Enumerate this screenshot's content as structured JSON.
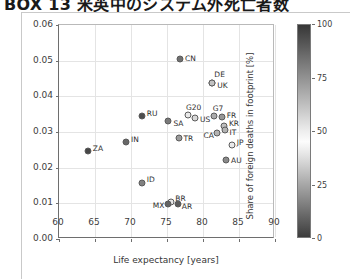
{
  "page_header": {
    "title": "BOX 13  米英中のシステム外死亡者数"
  },
  "chart_data": {
    "type": "scatter",
    "title": "",
    "xlabel": "Life expectancy [years]",
    "ylabel": "Lifetime-induced deaths [deaths/cap]",
    "xlim": [
      60,
      90
    ],
    "ylim": [
      0.0,
      0.06
    ],
    "xticks": [
      60,
      65,
      70,
      75,
      80,
      85,
      90
    ],
    "xticklabels": [
      "60",
      "65",
      "70",
      "75",
      "80",
      "85",
      "90"
    ],
    "yticks": [
      0.0,
      0.01,
      0.02,
      0.03,
      0.04,
      0.05,
      0.06
    ],
    "yticklabels": [
      "0.00",
      "0.01",
      "0.02",
      "0.03",
      "0.04",
      "0.05",
      "0.06"
    ],
    "grid": true,
    "legend": "none",
    "colorbar": {
      "label": "Share of foreign deaths in footprint [%]",
      "ticks": [
        0,
        25,
        50,
        75,
        100
      ],
      "ticklabels": [
        "0",
        "25",
        "50",
        "75",
        "100"
      ],
      "vmin": 0,
      "vmax": 100,
      "position": "right",
      "colormap": "grayscale"
    },
    "points": [
      {
        "label": "CN",
        "x": 76.8,
        "y": 0.0505,
        "c": 12,
        "lx": 5,
        "ly": -1
      },
      {
        "label": "DE",
        "x": 81.3,
        "y": 0.0438,
        "c": 62,
        "lx": 2,
        "ly": -9
      },
      {
        "label": "UK",
        "x": 81.3,
        "y": 0.0438,
        "c": 62,
        "lx": 5,
        "ly": 2
      },
      {
        "label": "RU",
        "x": 71.5,
        "y": 0.0345,
        "c": 94,
        "lx": 5,
        "ly": -3
      },
      {
        "label": "G20",
        "x": 77.9,
        "y": 0.0347,
        "c": 40,
        "lx": -2,
        "ly": -8
      },
      {
        "label": "US",
        "x": 78.9,
        "y": 0.034,
        "c": 36,
        "lx": 5,
        "ly": 1
      },
      {
        "label": "G7",
        "x": 81.5,
        "y": 0.0345,
        "c": 68,
        "lx": -1,
        "ly": -8
      },
      {
        "label": "FR",
        "x": 82.6,
        "y": 0.0343,
        "c": 74,
        "lx": 5,
        "ly": -2
      },
      {
        "label": "SA",
        "x": 75.2,
        "y": 0.033,
        "c": 14,
        "lx": 5,
        "ly": 2
      },
      {
        "label": "KR",
        "x": 82.9,
        "y": 0.0318,
        "c": 30,
        "lx": 5,
        "ly": -3
      },
      {
        "label": "IT",
        "x": 83.0,
        "y": 0.0305,
        "c": 66,
        "lx": 5,
        "ly": 2
      },
      {
        "label": "CA",
        "x": 82.0,
        "y": 0.0298,
        "c": 66,
        "lx": -14,
        "ly": 2
      },
      {
        "label": "TR",
        "x": 76.6,
        "y": 0.0282,
        "c": 22,
        "lx": 5,
        "ly": 0
      },
      {
        "label": "IN",
        "x": 69.3,
        "y": 0.0272,
        "c": 10,
        "lx": 5,
        "ly": -3
      },
      {
        "label": "ZA",
        "x": 64.0,
        "y": 0.0248,
        "c": 96,
        "lx": 5,
        "ly": -3
      },
      {
        "label": "JP",
        "x": 84.0,
        "y": 0.0263,
        "c": 40,
        "lx": 5,
        "ly": -3
      },
      {
        "label": "AU",
        "x": 83.2,
        "y": 0.0222,
        "c": 18,
        "lx": 5,
        "ly": 0
      },
      {
        "label": "ID",
        "x": 71.5,
        "y": 0.0157,
        "c": 16,
        "lx": 5,
        "ly": -4
      },
      {
        "label": "BR",
        "x": 75.6,
        "y": 0.0103,
        "c": 52,
        "lx": 4,
        "ly": -4
      },
      {
        "label": "MX",
        "x": 75.1,
        "y": 0.0098,
        "c": 88,
        "lx": -15,
        "ly": 1
      },
      {
        "label": "AR",
        "x": 76.5,
        "y": 0.0098,
        "c": 90,
        "lx": 4,
        "ly": 2
      }
    ]
  }
}
